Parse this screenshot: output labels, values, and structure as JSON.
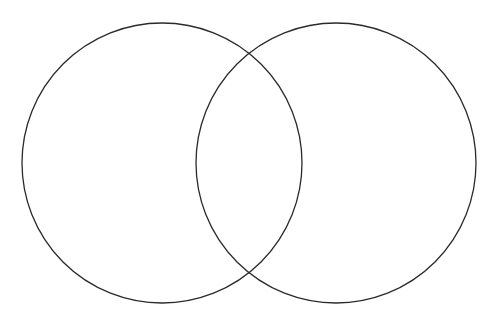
{
  "diagram": {
    "type": "venn",
    "background": "#ffffff",
    "stroke_color": "#2a2a2a",
    "stroke_width": 1.3,
    "circles": [
      {
        "id": "left",
        "cx": 162,
        "cy": 163,
        "r": 140
      },
      {
        "id": "right",
        "cx": 336,
        "cy": 163,
        "r": 140
      }
    ]
  }
}
